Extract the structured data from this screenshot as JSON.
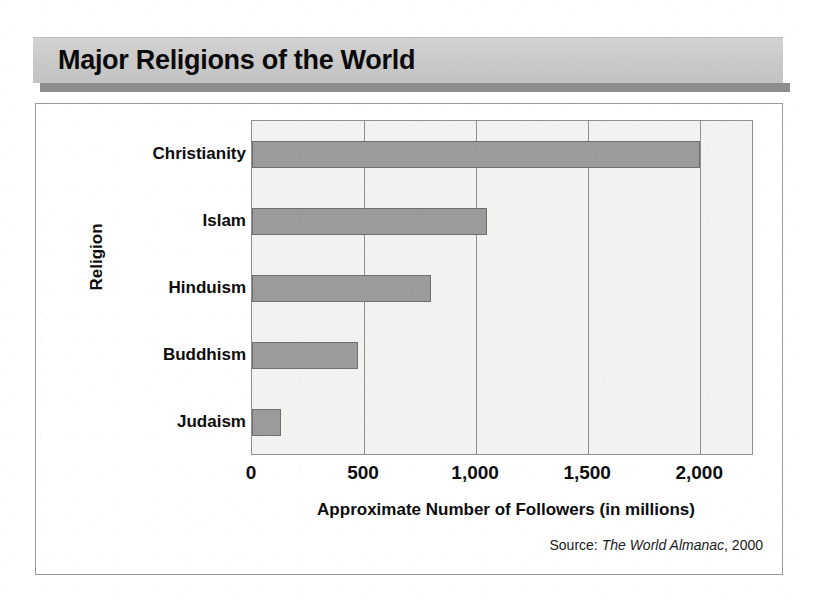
{
  "title": "Major Religions of the World",
  "source": {
    "prefix": "Source:",
    "work": "The World Almanac",
    "year": ", 2000"
  },
  "chart_data": {
    "type": "bar",
    "orientation": "horizontal",
    "title": "Major Religions of the World",
    "categories": [
      "Christianity",
      "Islam",
      "Hinduism",
      "Buddhism",
      "Judaism"
    ],
    "values": [
      2000,
      1050,
      800,
      475,
      130
    ],
    "xlabel": "Approximate Number of Followers (in millions)",
    "ylabel": "Religion",
    "xlim": [
      0,
      2240
    ],
    "xticks": [
      0,
      500,
      1000,
      1500,
      2000
    ],
    "xtick_labels": [
      "0",
      "500",
      "1,000",
      "1,500",
      "2,000"
    ],
    "grid": true,
    "legend": false,
    "bar_color": "#9b9b9b",
    "plot_background": "#f2f2f0",
    "banner_color": "#c9c9c9"
  }
}
